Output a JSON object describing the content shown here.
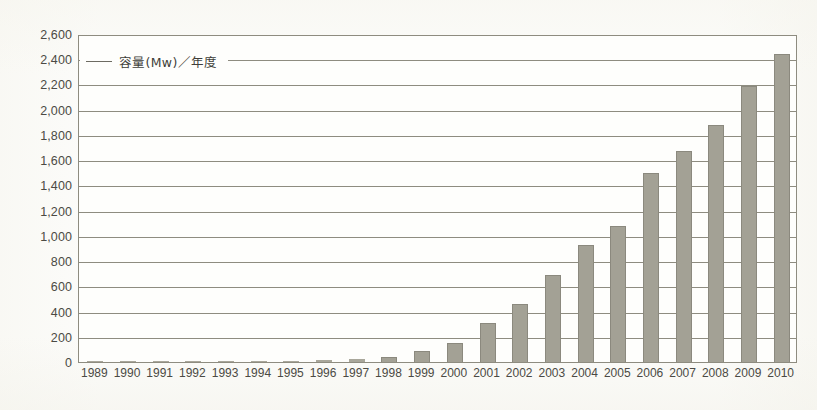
{
  "figure": {
    "background_color": "#fcfcfa",
    "bar_color": "#a3a195",
    "grid_color": "#8e8c80",
    "text_color": "#4b4a44"
  },
  "legend": {
    "label": "容量(Mw)／年度",
    "marker": "line-marker"
  },
  "chart_data": {
    "type": "bar",
    "title": "",
    "subtitle": "",
    "xlabel": "",
    "ylabel": "",
    "legend": [
      "容量(Mw)／年度"
    ],
    "legend_position": "top-left-inside",
    "grid": true,
    "ylim": [
      0,
      2600
    ],
    "ytick_step": 200,
    "ytick_labels": [
      "0",
      "200",
      "400",
      "600",
      "800",
      "1,000",
      "1,200",
      "1,400",
      "1,600",
      "1,800",
      "2,000",
      "2,200",
      "2,400",
      "2,600"
    ],
    "ytick_values": [
      0,
      200,
      400,
      600,
      800,
      1000,
      1200,
      1400,
      1600,
      1800,
      2000,
      2200,
      2400,
      2600
    ],
    "categories": [
      "1989",
      "1990",
      "1991",
      "1992",
      "1993",
      "1994",
      "1995",
      "1996",
      "1997",
      "1998",
      "1999",
      "2000",
      "2001",
      "2002",
      "2003",
      "2004",
      "2005",
      "2006",
      "2007",
      "2008",
      "2009",
      "2010"
    ],
    "values": [
      1,
      1,
      5,
      6,
      6,
      7,
      10,
      14,
      22,
      38,
      88,
      150,
      313,
      463,
      686,
      928,
      1080,
      1500,
      1674,
      1880,
      2186,
      2440
    ]
  }
}
